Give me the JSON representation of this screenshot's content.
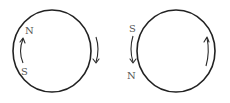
{
  "figure": {
    "panels": [
      {
        "id": "left",
        "ring": {
          "cx": 52,
          "cy": 51,
          "rx": 39,
          "ry": 41
        },
        "labels": [
          {
            "text": "N",
            "x": 25,
            "y": 34
          },
          {
            "text": "S",
            "x": 21,
            "y": 75
          }
        ],
        "outer_arrow_direction": "up",
        "inner_arrow_direction": "down"
      },
      {
        "id": "right",
        "ring": {
          "cx": 176,
          "cy": 51,
          "rx": 39,
          "ry": 41
        },
        "labels": [
          {
            "text": "S",
            "x": 129,
            "y": 32
          },
          {
            "text": "N",
            "x": 127,
            "y": 79
          }
        ],
        "outer_arrow_direction": "down",
        "inner_arrow_direction": "up"
      }
    ],
    "colors": {
      "stroke": "#222222",
      "label": "#555555",
      "background": "#ffffff"
    }
  }
}
